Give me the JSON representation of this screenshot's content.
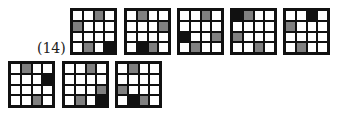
{
  "figure": {
    "label": "(14)",
    "colors": {
      "white": "#ffffff",
      "gray": "#808080",
      "black": "#111111"
    },
    "legend_codes": {
      "W": "white",
      "G": "gray",
      "B": "black"
    },
    "grids": [
      {
        "id": 1,
        "row": "top",
        "x": 70,
        "y": 8,
        "cells": [
          [
            "W",
            "W",
            "G",
            "W"
          ],
          [
            "G",
            "W",
            "W",
            "W"
          ],
          [
            "W",
            "W",
            "W",
            "W"
          ],
          [
            "W",
            "G",
            "W",
            "B"
          ]
        ]
      },
      {
        "id": 2,
        "row": "top",
        "x": 124,
        "y": 8,
        "cells": [
          [
            "W",
            "G",
            "W",
            "W"
          ],
          [
            "W",
            "W",
            "W",
            "G"
          ],
          [
            "W",
            "W",
            "W",
            "W"
          ],
          [
            "W",
            "B",
            "G",
            "W"
          ]
        ]
      },
      {
        "id": 3,
        "row": "top",
        "x": 177,
        "y": 8,
        "cells": [
          [
            "W",
            "W",
            "G",
            "W"
          ],
          [
            "W",
            "W",
            "W",
            "W"
          ],
          [
            "B",
            "W",
            "W",
            "G"
          ],
          [
            "W",
            "G",
            "W",
            "W"
          ]
        ]
      },
      {
        "id": 4,
        "row": "top",
        "x": 230,
        "y": 8,
        "cells": [
          [
            "B",
            "G",
            "W",
            "W"
          ],
          [
            "W",
            "W",
            "W",
            "W"
          ],
          [
            "G",
            "W",
            "W",
            "W"
          ],
          [
            "W",
            "W",
            "G",
            "W"
          ]
        ]
      },
      {
        "id": 5,
        "row": "top",
        "x": 283,
        "y": 8,
        "cells": [
          [
            "W",
            "W",
            "B",
            "W"
          ],
          [
            "G",
            "W",
            "W",
            "W"
          ],
          [
            "W",
            "W",
            "W",
            "W"
          ],
          [
            "W",
            "G",
            "W",
            "W"
          ]
        ]
      },
      {
        "id": 6,
        "row": "bottom",
        "x": 8,
        "y": 61,
        "cells": [
          [
            "W",
            "G",
            "W",
            "W"
          ],
          [
            "W",
            "W",
            "W",
            "B"
          ],
          [
            "W",
            "W",
            "W",
            "W"
          ],
          [
            "W",
            "W",
            "G",
            "W"
          ]
        ]
      },
      {
        "id": 7,
        "row": "bottom",
        "x": 62,
        "y": 61,
        "cells": [
          [
            "W",
            "W",
            "G",
            "W"
          ],
          [
            "W",
            "W",
            "W",
            "W"
          ],
          [
            "W",
            "W",
            "W",
            "G"
          ],
          [
            "W",
            "G",
            "W",
            "B"
          ]
        ]
      },
      {
        "id": 8,
        "row": "bottom",
        "x": 115,
        "y": 61,
        "cells": [
          [
            "W",
            "G",
            "W",
            "W"
          ],
          [
            "W",
            "W",
            "W",
            "W"
          ],
          [
            "G",
            "W",
            "W",
            "W"
          ],
          [
            "W",
            "B",
            "G",
            "W"
          ]
        ]
      }
    ]
  }
}
